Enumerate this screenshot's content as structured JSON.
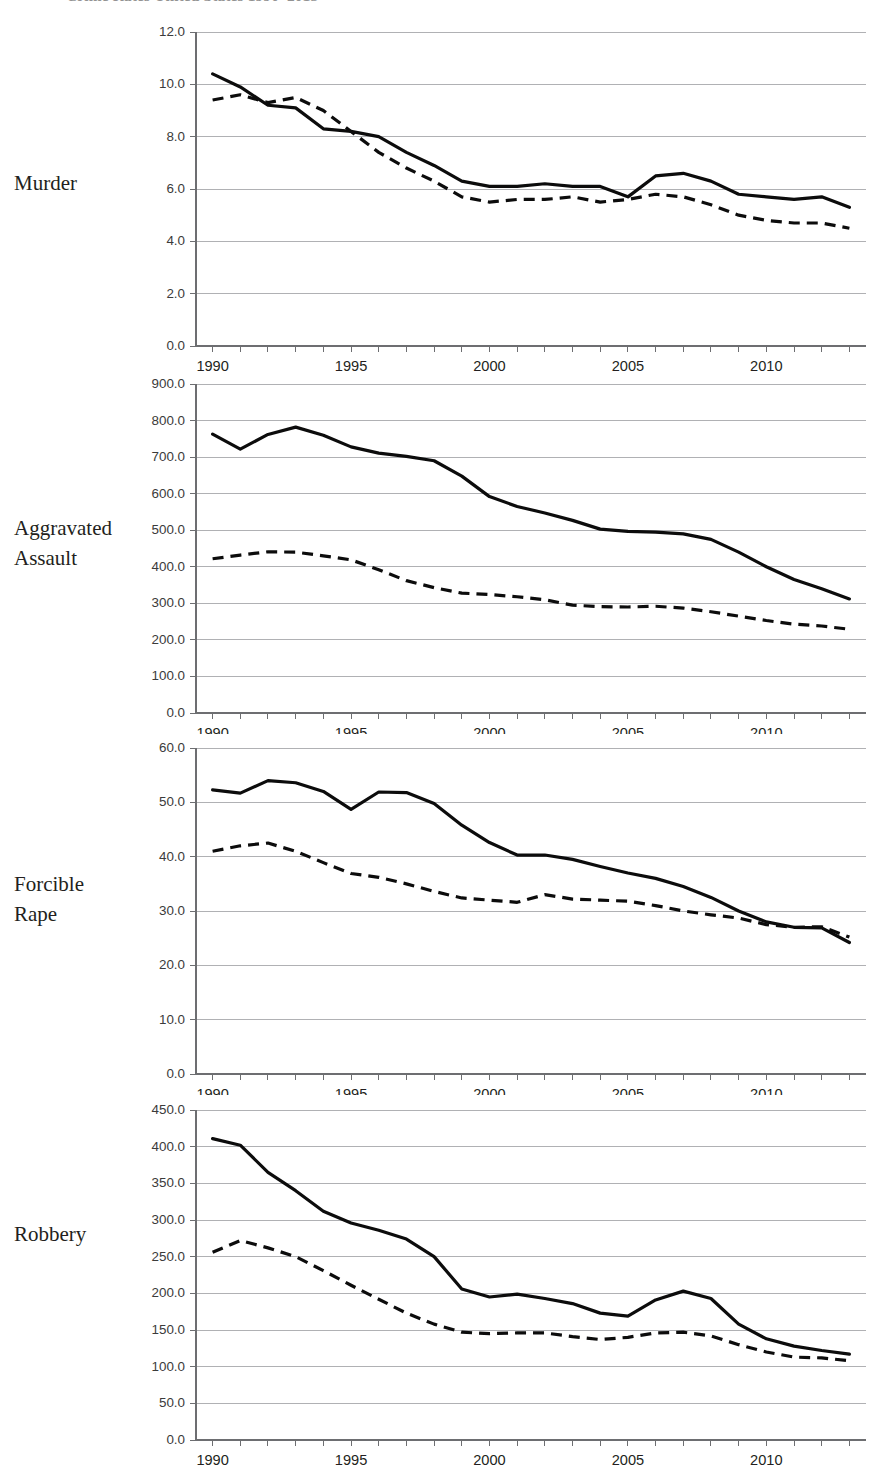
{
  "figure": {
    "title": "Crime Rates United States 1990–2013",
    "title_clipped": true
  },
  "panels": [
    {
      "label": "Murder"
    },
    {
      "label": "Aggravated\nAssault"
    },
    {
      "label": "Forcible\nRape"
    },
    {
      "label": "Robbery"
    }
  ],
  "chart_data": [
    {
      "type": "line",
      "title": "Murder",
      "xlabel": "",
      "ylabel": "",
      "xlim": [
        1989.4,
        2013.6
      ],
      "ylim": [
        0.0,
        12.0
      ],
      "grid": true,
      "legend": "none",
      "x": [
        1990,
        1991,
        1992,
        1993,
        1994,
        1995,
        1996,
        1997,
        1998,
        1999,
        2000,
        2001,
        2002,
        2003,
        2004,
        2005,
        2006,
        2007,
        2008,
        2009,
        2010,
        2011,
        2012,
        2013
      ],
      "xticks": [
        1990,
        1995,
        2000,
        2005,
        2010
      ],
      "xtick_labels": [
        "1990",
        "1995",
        "2000",
        "2005",
        "2010"
      ],
      "yticks": [
        0.0,
        2.0,
        4.0,
        6.0,
        8.0,
        10.0,
        12.0
      ],
      "ytick_labels": [
        "0.0",
        "2.0",
        "4.0",
        "6.0",
        "8.0",
        "10.0",
        "12.0"
      ],
      "series": [
        {
          "name": "solid",
          "style": "solid",
          "values": [
            10.4,
            9.9,
            9.2,
            9.1,
            8.3,
            8.2,
            8.0,
            7.4,
            6.9,
            6.3,
            6.1,
            6.1,
            6.2,
            6.1,
            6.1,
            5.7,
            6.5,
            6.6,
            6.3,
            5.8,
            5.7,
            5.6,
            5.7,
            5.3
          ],
          "values_axis": [
            10.4,
            9.9,
            9.2,
            9.1,
            8.3,
            8.2,
            8.0,
            7.4,
            6.9,
            6.3,
            6.1,
            6.1,
            6.2,
            6.1,
            6.1,
            5.7,
            6.5,
            6.6,
            6.3,
            5.8,
            5.7,
            5.6,
            5.7,
            5.3
          ]
        },
        {
          "name": "dashed",
          "style": "dashed",
          "values": [
            9.4,
            9.6,
            9.3,
            9.5,
            9.0,
            8.2,
            7.4,
            6.8,
            6.3,
            5.7,
            5.5,
            5.6,
            5.6,
            5.7,
            5.5,
            5.6,
            5.8,
            5.7,
            5.4,
            5.0,
            4.8,
            4.7,
            4.7,
            4.5
          ]
        }
      ]
    },
    {
      "type": "line",
      "title": "Aggravated Assault",
      "xlabel": "",
      "ylabel": "",
      "xlim": [
        1989.4,
        2013.6
      ],
      "ylim": [
        0.0,
        900.0
      ],
      "grid": true,
      "legend": "none",
      "x": [
        1990,
        1991,
        1992,
        1993,
        1994,
        1995,
        1996,
        1997,
        1998,
        1999,
        2000,
        2001,
        2002,
        2003,
        2004,
        2005,
        2006,
        2007,
        2008,
        2009,
        2010,
        2011,
        2012,
        2013
      ],
      "xticks": [
        1990,
        1995,
        2000,
        2005,
        2010
      ],
      "xtick_labels": [
        "1990",
        "1995",
        "2000",
        "2005",
        "2010"
      ],
      "yticks": [
        0.0,
        100.0,
        200.0,
        300.0,
        400.0,
        500.0,
        600.0,
        700.0,
        800.0,
        900.0
      ],
      "ytick_labels": [
        "0.0",
        "100.0",
        "200.0",
        "300.0",
        "400.0",
        "500.0",
        "600.0",
        "700.0",
        "800.0",
        "900.0"
      ],
      "series": [
        {
          "name": "solid",
          "style": "solid",
          "values": [
            763,
            722,
            762,
            782,
            760,
            728,
            711,
            702,
            690,
            648,
            592,
            565,
            547,
            527,
            503,
            497,
            495,
            490,
            475,
            440,
            400,
            365,
            340,
            312
          ]
        },
        {
          "name": "dashed",
          "style": "dashed",
          "values": [
            422,
            432,
            441,
            440,
            430,
            419,
            392,
            362,
            343,
            328,
            324,
            318,
            310,
            295,
            291,
            290,
            292,
            287,
            277,
            265,
            253,
            243,
            238,
            229
          ]
        }
      ]
    },
    {
      "type": "line",
      "title": "Forcible Rape",
      "xlabel": "",
      "ylabel": "",
      "xlim": [
        1989.4,
        2013.6
      ],
      "ylim": [
        0.0,
        60.0
      ],
      "grid": true,
      "legend": "none",
      "x": [
        1990,
        1991,
        1992,
        1993,
        1994,
        1995,
        1996,
        1997,
        1998,
        1999,
        2000,
        2001,
        2002,
        2003,
        2004,
        2005,
        2006,
        2007,
        2008,
        2009,
        2010,
        2011,
        2012,
        2013
      ],
      "xticks": [
        1990,
        1995,
        2000,
        2005,
        2010
      ],
      "xtick_labels": [
        "1990",
        "1995",
        "2000",
        "2005",
        "2010"
      ],
      "yticks": [
        0.0,
        10.0,
        20.0,
        30.0,
        40.0,
        50.0,
        60.0
      ],
      "ytick_labels": [
        "0.0",
        "10.0",
        "20.0",
        "30.0",
        "40.0",
        "50.0",
        "60.0"
      ],
      "series": [
        {
          "name": "solid",
          "style": "solid",
          "values": [
            52.3,
            51.7,
            54.0,
            53.6,
            52.0,
            48.7,
            51.9,
            51.8,
            49.8,
            45.8,
            42.6,
            40.3,
            40.3,
            39.5,
            38.2,
            37.0,
            36.0,
            34.5,
            32.5,
            30.0,
            28.0,
            27.0,
            26.9,
            24.2
          ]
        },
        {
          "name": "dashed",
          "style": "dashed",
          "values": [
            41.0,
            42.0,
            42.5,
            41.0,
            38.9,
            36.9,
            36.2,
            35.0,
            33.6,
            32.4,
            32.0,
            31.6,
            33.0,
            32.2,
            32.0,
            31.8,
            31.0,
            30.0,
            29.3,
            28.7,
            27.5,
            27.0,
            27.1,
            25.2
          ]
        }
      ]
    },
    {
      "type": "line",
      "title": "Robbery",
      "xlabel": "",
      "ylabel": "",
      "xlim": [
        1989.4,
        2013.6
      ],
      "ylim": [
        0.0,
        450.0
      ],
      "grid": true,
      "legend": "none",
      "x": [
        1990,
        1991,
        1992,
        1993,
        1994,
        1995,
        1996,
        1997,
        1998,
        1999,
        2000,
        2001,
        2002,
        2003,
        2004,
        2005,
        2006,
        2007,
        2008,
        2009,
        2010,
        2011,
        2012,
        2013
      ],
      "xticks": [
        1990,
        1995,
        2000,
        2005,
        2010
      ],
      "xtick_labels": [
        "1990",
        "1995",
        "2000",
        "2005",
        "2010"
      ],
      "yticks": [
        0.0,
        50.0,
        100.0,
        150.0,
        200.0,
        250.0,
        300.0,
        350.0,
        400.0,
        450.0
      ],
      "ytick_labels": [
        "0.0",
        "50.0",
        "100.0",
        "150.0",
        "200.0",
        "250.0",
        "300.0",
        "350.0",
        "400.0",
        "450.0"
      ],
      "series": [
        {
          "name": "solid",
          "style": "solid",
          "values": [
            411,
            402,
            365,
            340,
            312,
            296,
            286,
            274,
            250,
            206,
            195,
            199,
            193,
            186,
            173,
            169,
            191,
            203,
            193,
            158,
            138,
            128,
            122,
            117
          ]
        },
        {
          "name": "dashed",
          "style": "dashed",
          "values": [
            256,
            272,
            262,
            250,
            231,
            211,
            192,
            173,
            158,
            147,
            145,
            146,
            146,
            141,
            137,
            140,
            146,
            147,
            142,
            130,
            120,
            113,
            112,
            108
          ]
        }
      ]
    }
  ]
}
